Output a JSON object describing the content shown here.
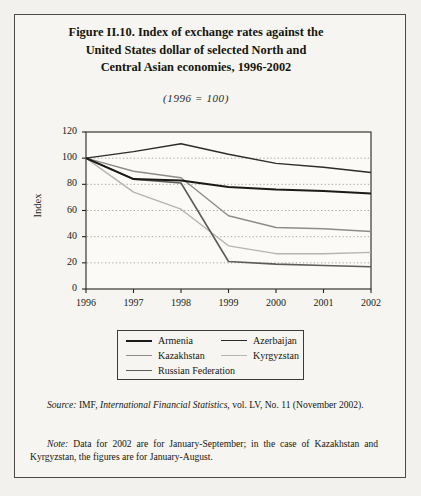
{
  "figure": {
    "title_lines": [
      "Figure II.10.  Index of exchange rates against the",
      "United States dollar of selected North and",
      "Central Asian economies, 1996-2002"
    ],
    "subtitle": "(1996  =  100)"
  },
  "chart_data": {
    "type": "line",
    "title": "Figure II.10. Index of exchange rates against the United States dollar of selected North and Central Asian economies, 1996-2002",
    "subtitle": "(1996 = 100)",
    "xlabel": "",
    "ylabel": "Index",
    "x": [
      1996,
      1997,
      1998,
      1999,
      2000,
      2001,
      2002
    ],
    "xtick_labels": [
      "1996",
      "1997",
      "1998",
      "1999",
      "2000",
      "2001",
      "2002"
    ],
    "ytick_labels": [
      "0",
      "20",
      "40",
      "60",
      "80",
      "100",
      "120"
    ],
    "ylim": [
      0,
      120
    ],
    "ytick_step": 20,
    "grid": "horizontal-dotted",
    "legend_position": "below-plot",
    "series": [
      {
        "name": "Armenia",
        "color": "#1a1a18",
        "width": 2.0,
        "values": [
          100,
          84,
          83,
          78,
          76,
          75,
          73
        ]
      },
      {
        "name": "Azerbaijan",
        "color": "#2b2b28",
        "width": 1.4,
        "values": [
          100,
          105,
          111,
          103,
          96,
          93,
          89
        ]
      },
      {
        "name": "Kazakhstan",
        "color": "#8c8c88",
        "width": 1.4,
        "values": [
          100,
          90,
          85,
          56,
          47,
          46,
          44
        ]
      },
      {
        "name": "Kyrgyzstan",
        "color": "#b4b4b0",
        "width": 1.4,
        "values": [
          100,
          74,
          61,
          33,
          27,
          27,
          28
        ]
      },
      {
        "name": "Russian Federation",
        "color": "#5c5c58",
        "width": 1.6,
        "values": [
          100,
          84,
          81,
          21,
          19,
          18,
          17
        ]
      }
    ]
  },
  "legend": {
    "entries": [
      {
        "label": "Armenia"
      },
      {
        "label": "Azerbaijan"
      },
      {
        "label": "Kazakhstan"
      },
      {
        "label": "Kyrgyzstan"
      },
      {
        "label": "Russian Federation"
      }
    ]
  },
  "notes": {
    "source_label": "Source:",
    "source_text_1": "IMF, ",
    "source_italic": "International Financial Statistics,",
    "source_text_2": " vol. LV, No. 11 (November 2002).",
    "note_label": "Note:",
    "note_text": "Data for 2002 are for January-September; in the case of Kazakhstan and Kyrgyzstan, the figures are for January-August."
  }
}
